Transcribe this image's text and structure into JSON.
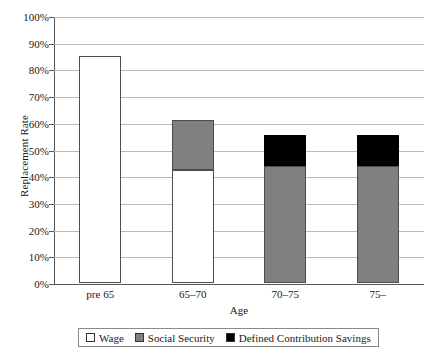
{
  "chart_data": {
    "type": "bar",
    "title": "",
    "subtitle": "",
    "xlabel": "Age",
    "ylabel": "Replacement Rate",
    "categories": [
      "pre 65",
      "65–70",
      "70–75",
      "75–"
    ],
    "ylim": [
      0,
      100
    ],
    "ytick_labels": [
      "0%",
      "10%",
      "20%",
      "30%",
      "40%",
      "50%",
      "60%",
      "70%",
      "80%",
      "90%",
      "100%"
    ],
    "ytick_values": [
      0,
      10,
      20,
      30,
      40,
      50,
      60,
      70,
      80,
      90,
      100
    ],
    "grid": true,
    "stacked": true,
    "legend_position": "bottom",
    "series": [
      {
        "name": "Wage",
        "color": "#ffffff",
        "values": [
          85.0,
          42.5,
          0,
          0
        ]
      },
      {
        "name": "Social Security",
        "color": "#808080",
        "values": [
          0,
          18.5,
          44.0,
          44.0
        ]
      },
      {
        "name": "Defined Contribution Savings",
        "color": "#000000",
        "values": [
          0,
          0,
          11.5,
          11.5
        ]
      }
    ],
    "totals": [
      85.0,
      61.0,
      55.5,
      55.5
    ]
  },
  "axes": {
    "y_title": "Replacement Rate",
    "x_title": "Age",
    "y_ticks": [
      {
        "label": "100%",
        "value": 100
      },
      {
        "label": "90%",
        "value": 90
      },
      {
        "label": "80%",
        "value": 80
      },
      {
        "label": "70%",
        "value": 70
      },
      {
        "label": "60%",
        "value": 60
      },
      {
        "label": "50%",
        "value": 50
      },
      {
        "label": "40%",
        "value": 40
      },
      {
        "label": "30%",
        "value": 30
      },
      {
        "label": "20%",
        "value": 20
      },
      {
        "label": "10%",
        "value": 10
      },
      {
        "label": "0%",
        "value": 0
      }
    ],
    "x_ticks": [
      {
        "label": "pre 65"
      },
      {
        "label": "65–70"
      },
      {
        "label": "70–75"
      },
      {
        "label": "75–"
      }
    ]
  },
  "legend": {
    "items": [
      {
        "label": "Wage",
        "color": "#ffffff"
      },
      {
        "label": "Social Security",
        "color": "#808080"
      },
      {
        "label": "Defined Contribution Savings",
        "color": "#000000"
      }
    ]
  },
  "colors": {
    "wage": "#ffffff",
    "social_security": "#808080",
    "defined_contribution": "#000000",
    "gridline": "#b9b9b9",
    "axis": "#555555"
  }
}
